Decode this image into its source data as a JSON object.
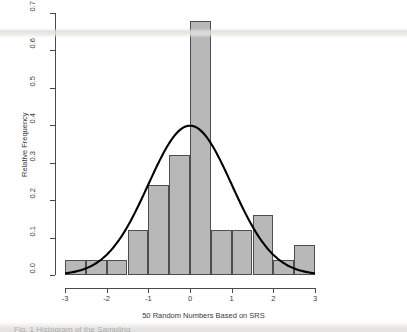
{
  "figure": {
    "background_color": "#ffffff",
    "bar_fill_color": "#b8b8b8",
    "bar_border_color": "#4d4d4d",
    "curve_color": "#000000",
    "axis_color": "#4a4a4a"
  },
  "caption_sliver": "Fig. 1  Histogram of the Sampling",
  "chart_data": {
    "type": "bar",
    "title": "",
    "subtitle": "",
    "xlabel": "50 Random Numbers Based on SRS",
    "ylabel": "Relative Frequency",
    "xlim": [
      -3,
      3
    ],
    "ylim": [
      0.0,
      0.7
    ],
    "grid": false,
    "legend": "none",
    "bin_width": 0.5,
    "bin_edges": [
      -3.0,
      -2.5,
      -2.0,
      -1.5,
      -1.0,
      -0.5,
      0.0,
      0.5,
      1.0,
      1.5,
      2.0,
      2.5,
      3.0
    ],
    "categories": [
      "-3.0 to -2.5",
      "-2.5 to -2.0",
      "-2.0 to -1.5",
      "-1.5 to -1.0",
      "-1.0 to -0.5",
      "-0.5 to 0.0",
      "0.0 to 0.5",
      "0.5 to 1.0",
      "1.0 to 1.5",
      "1.5 to 2.0",
      "2.0 to 2.5",
      "2.5 to 3.0"
    ],
    "values": [
      0.04,
      0.04,
      0.04,
      0.12,
      0.24,
      0.32,
      0.68,
      0.12,
      0.12,
      0.16,
      0.04,
      0.08
    ],
    "xticks": [
      -3,
      -2,
      -1,
      0,
      1,
      2,
      3
    ],
    "xtick_labels": [
      "-3",
      "-2",
      "-1",
      "0",
      "1",
      "2",
      "3"
    ],
    "yticks": [
      0.0,
      0.1,
      0.2,
      0.3,
      0.4,
      0.5,
      0.6,
      0.7
    ],
    "ytick_labels": [
      "0.0",
      "0.1",
      "0.2",
      "0.3",
      "0.4",
      "0.5",
      "0.6",
      "0.7"
    ],
    "overlay_curve": {
      "name": "normal density",
      "type": "line",
      "mean": 0,
      "sd": 1,
      "peak_value": 0.399,
      "peak_x": 0
    }
  }
}
